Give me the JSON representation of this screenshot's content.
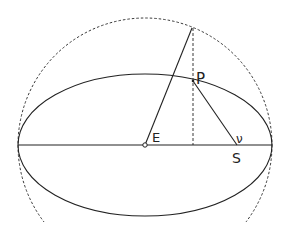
{
  "diagram": {
    "labels": {
      "P": "P",
      "E": "E",
      "S": "S",
      "nu": "ν"
    },
    "colors": {
      "stroke": "#222222",
      "background": "#ffffff"
    }
  }
}
